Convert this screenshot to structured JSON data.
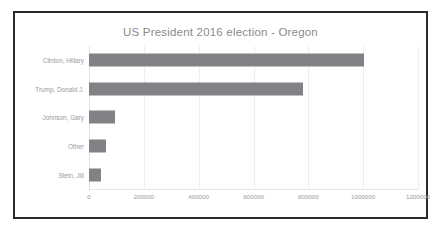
{
  "chart_data": {
    "type": "bar",
    "orientation": "horizontal",
    "title": "US President 2016 election - Oregon",
    "xlabel": "",
    "ylabel": "",
    "categories": [
      "Clinton, Hillary",
      "Trump, Donald J.",
      "Johnson, Gary",
      "Other",
      "Stein, Jill"
    ],
    "values": [
      1002000,
      782000,
      94000,
      62000,
      44000
    ],
    "xlim": [
      0,
      1200000
    ],
    "xticks": [
      0,
      200000,
      400000,
      600000,
      800000,
      1000000,
      1200000
    ],
    "xtick_labels": [
      "0",
      "200000",
      "400000",
      "600000",
      "800000",
      "1000000",
      "1200000"
    ],
    "grid": true,
    "legend": false,
    "bar_color": "#808285",
    "title_color": "#8a8a8a",
    "label_color": "#9a9a9a",
    "border_color": "#2b2b2b",
    "background": "#ffffff"
  }
}
